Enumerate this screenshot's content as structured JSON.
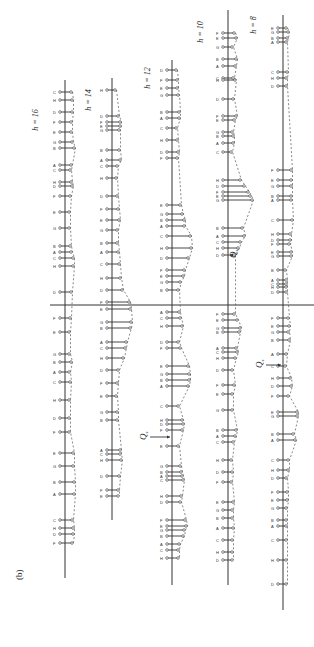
{
  "figure": {
    "panel_label": "(b)",
    "orientation": "rotated 90 degrees counter-clockwise",
    "divider": {
      "y": 305,
      "x1": 50,
      "x2": 314
    },
    "q_labels": [
      {
        "text": "Q",
        "sub": "s",
        "column": "h=10",
        "x": 236,
        "y": 258,
        "arrow_to_x": 228
      },
      {
        "text": "Q",
        "sub": "s",
        "column": "h=8",
        "x": 262,
        "y": 368,
        "arrow_to_x": 283
      },
      {
        "text": "Q",
        "sub": "s",
        "column": "h=12",
        "x": 146,
        "y": 440,
        "arrow_to_x": 172
      }
    ],
    "columns": [
      {
        "label": "h = 16",
        "label_x": 38,
        "label_y": 120,
        "axis_x": 65,
        "top": 80,
        "bottom": 578,
        "sticks": [
          [
            92,
            6
          ],
          [
            100,
            7
          ],
          [
            112,
            7
          ],
          [
            122,
            6
          ],
          [
            132,
            6
          ],
          [
            142,
            7
          ],
          [
            148,
            9
          ],
          [
            165,
            6
          ],
          [
            170,
            5
          ],
          [
            182,
            6
          ],
          [
            186,
            7
          ],
          [
            196,
            5
          ],
          [
            212,
            4
          ],
          [
            228,
            4
          ],
          [
            246,
            5
          ],
          [
            252,
            6
          ],
          [
            258,
            8
          ],
          [
            266,
            8
          ],
          [
            292,
            6
          ],
          [
            318,
            5
          ],
          [
            332,
            4
          ],
          [
            354,
            4
          ],
          [
            362,
            6
          ],
          [
            372,
            4
          ],
          [
            382,
            5
          ],
          [
            400,
            4
          ],
          [
            418,
            4
          ],
          [
            432,
            4
          ],
          [
            453,
            8
          ],
          [
            466,
            8
          ],
          [
            482,
            9
          ],
          [
            494,
            9
          ],
          [
            520,
            7
          ],
          [
            528,
            8
          ],
          [
            534,
            8
          ],
          [
            543,
            7
          ]
        ]
      },
      {
        "label": "h = 14",
        "label_x": 91,
        "label_y": 100,
        "axis_x": 112,
        "top": 78,
        "bottom": 520,
        "sticks": [
          [
            90,
            3
          ],
          [
            116,
            6
          ],
          [
            122,
            8
          ],
          [
            126,
            8
          ],
          [
            130,
            7
          ],
          [
            150,
            7
          ],
          [
            160,
            8
          ],
          [
            166,
            5
          ],
          [
            178,
            4
          ],
          [
            196,
            5
          ],
          [
            209,
            6
          ],
          [
            220,
            7
          ],
          [
            230,
            5
          ],
          [
            243,
            5
          ],
          [
            252,
            6
          ],
          [
            264,
            7
          ],
          [
            278,
            8
          ],
          [
            290,
            10
          ],
          [
            302,
            17
          ],
          [
            309,
            18
          ],
          [
            322,
            19
          ],
          [
            328,
            18
          ],
          [
            342,
            14
          ],
          [
            348,
            13
          ],
          [
            358,
            11
          ],
          [
            370,
            6
          ],
          [
            383,
            5
          ],
          [
            396,
            4
          ],
          [
            412,
            5
          ],
          [
            420,
            5
          ],
          [
            450,
            8
          ],
          [
            454,
            8
          ],
          [
            460,
            9
          ],
          [
            476,
            7
          ],
          [
            490,
            6
          ],
          [
            496,
            6
          ]
        ]
      },
      {
        "label": "h = 12",
        "label_x": 150,
        "label_y": 78,
        "axis_x": 172,
        "top": 60,
        "bottom": 585,
        "sticks": [
          [
            70,
            4
          ],
          [
            80,
            5
          ],
          [
            88,
            5
          ],
          [
            95,
            6
          ],
          [
            112,
            7
          ],
          [
            118,
            7
          ],
          [
            128,
            4
          ],
          [
            140,
            5
          ],
          [
            152,
            6
          ],
          [
            158,
            5
          ],
          [
            205,
            8
          ],
          [
            214,
            10
          ],
          [
            220,
            12
          ],
          [
            226,
            12
          ],
          [
            236,
            18
          ],
          [
            248,
            19
          ],
          [
            258,
            16
          ],
          [
            270,
            12
          ],
          [
            276,
            11
          ],
          [
            282,
            8
          ],
          [
            290,
            6
          ],
          [
            312,
            7
          ],
          [
            318,
            8
          ],
          [
            326,
            10
          ],
          [
            342,
            6
          ],
          [
            348,
            8
          ],
          [
            366,
            16
          ],
          [
            374,
            17
          ],
          [
            380,
            17
          ],
          [
            386,
            16
          ],
          [
            406,
            6
          ],
          [
            420,
            10
          ],
          [
            424,
            11
          ],
          [
            430,
            10
          ],
          [
            446,
            6
          ],
          [
            466,
            8
          ],
          [
            472,
            9
          ],
          [
            476,
            10
          ],
          [
            480,
            11
          ],
          [
            496,
            9
          ],
          [
            502,
            8
          ],
          [
            520,
            13
          ],
          [
            526,
            14
          ],
          [
            530,
            12
          ],
          [
            536,
            11
          ],
          [
            544,
            7
          ],
          [
            550,
            6
          ],
          [
            558,
            6
          ]
        ]
      },
      {
        "label": "h = 10",
        "label_x": 203,
        "label_y": 32,
        "axis_x": 228,
        "top": 10,
        "bottom": 585,
        "sticks": [
          [
            33,
            6
          ],
          [
            38,
            8
          ],
          [
            47,
            4
          ],
          [
            59,
            8
          ],
          [
            66,
            7
          ],
          [
            78,
            5
          ],
          [
            80,
            7
          ],
          [
            99,
            5
          ],
          [
            116,
            8
          ],
          [
            120,
            6
          ],
          [
            132,
            4
          ],
          [
            136,
            5
          ],
          [
            143,
            5
          ],
          [
            152,
            3
          ],
          [
            180,
            12
          ],
          [
            186,
            16
          ],
          [
            192,
            20
          ],
          [
            196,
            22
          ],
          [
            200,
            24
          ],
          [
            228,
            14
          ],
          [
            236,
            16
          ],
          [
            242,
            12
          ],
          [
            248,
            10
          ],
          [
            255,
            6
          ],
          [
            314,
            6
          ],
          [
            320,
            9
          ],
          [
            328,
            12
          ],
          [
            332,
            11
          ],
          [
            348,
            8
          ],
          [
            352,
            9
          ],
          [
            358,
            7
          ],
          [
            370,
            4
          ],
          [
            385,
            6
          ],
          [
            394,
            4
          ],
          [
            410,
            4
          ],
          [
            430,
            8
          ],
          [
            436,
            7
          ],
          [
            442,
            5
          ],
          [
            460,
            3
          ],
          [
            472,
            4
          ],
          [
            482,
            3
          ],
          [
            502,
            5
          ],
          [
            510,
            4
          ],
          [
            518,
            4
          ],
          [
            528,
            5
          ],
          [
            540,
            4
          ],
          [
            552,
            4
          ],
          [
            560,
            4
          ]
        ]
      },
      {
        "label": "h = 8",
        "label_x": 256,
        "label_y": 25,
        "axis_x": 283,
        "top": 15,
        "bottom": 610,
        "sticks": [
          [
            28,
            3
          ],
          [
            32,
            5
          ],
          [
            38,
            4
          ],
          [
            42,
            3
          ],
          [
            72,
            4
          ],
          [
            78,
            3
          ],
          [
            86,
            3
          ],
          [
            170,
            8
          ],
          [
            180,
            8
          ],
          [
            186,
            8
          ],
          [
            196,
            8
          ],
          [
            200,
            8
          ],
          [
            220,
            9
          ],
          [
            234,
            7
          ],
          [
            240,
            7
          ],
          [
            244,
            6
          ],
          [
            252,
            8
          ],
          [
            256,
            8
          ],
          [
            270,
            2
          ],
          [
            280,
            3
          ],
          [
            284,
            3
          ],
          [
            287,
            3
          ],
          [
            292,
            3
          ],
          [
            318,
            5
          ],
          [
            326,
            6
          ],
          [
            332,
            5
          ],
          [
            340,
            6
          ],
          [
            354,
            3
          ],
          [
            366,
            2
          ],
          [
            378,
            7
          ],
          [
            386,
            8
          ],
          [
            396,
            5
          ],
          [
            412,
            14
          ],
          [
            416,
            14
          ],
          [
            434,
            10
          ],
          [
            440,
            12
          ],
          [
            460,
            5
          ],
          [
            470,
            5
          ],
          [
            478,
            3
          ],
          [
            492,
            4
          ],
          [
            500,
            4
          ],
          [
            508,
            3
          ],
          [
            520,
            3
          ],
          [
            526,
            3
          ],
          [
            540,
            3
          ],
          [
            560,
            3
          ],
          [
            584,
            3
          ]
        ]
      }
    ]
  }
}
